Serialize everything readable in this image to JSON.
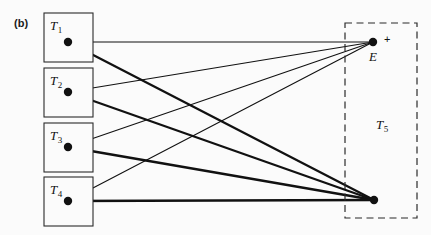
{
  "figure": {
    "panel_label": "(b)",
    "width": 431,
    "height": 235,
    "background_color": "#fbfbfb",
    "ink_color": "#111111"
  },
  "terminals": [
    {
      "id": "T1",
      "label": "T",
      "subscript": "1",
      "box": {
        "x": 44,
        "y": 13,
        "w": 49,
        "h": 49
      },
      "node": {
        "x": 68,
        "y": 42
      },
      "label_pos": {
        "x": 50,
        "y": 30
      }
    },
    {
      "id": "T2",
      "label": "T",
      "subscript": "2",
      "box": {
        "x": 44,
        "y": 68,
        "w": 49,
        "h": 49
      },
      "node": {
        "x": 68,
        "y": 92
      },
      "label_pos": {
        "x": 50,
        "y": 85
      }
    },
    {
      "id": "T3",
      "label": "T",
      "subscript": "3",
      "box": {
        "x": 44,
        "y": 123,
        "w": 49,
        "h": 49
      },
      "node": {
        "x": 68,
        "y": 147
      },
      "label_pos": {
        "x": 50,
        "y": 140
      }
    },
    {
      "id": "T4",
      "label": "T",
      "subscript": "4",
      "box": {
        "x": 44,
        "y": 177,
        "w": 49,
        "h": 49
      },
      "node": {
        "x": 68,
        "y": 201
      },
      "label_pos": {
        "x": 50,
        "y": 194
      }
    }
  ],
  "region": {
    "id": "T5",
    "label": "T",
    "subscript": "5",
    "box": {
      "x": 345,
      "y": 23,
      "w": 72,
      "h": 195
    },
    "label_pos": {
      "x": 376,
      "y": 129
    },
    "style": "dashed"
  },
  "endpoints": [
    {
      "id": "E",
      "label": "E",
      "sign": "+",
      "node": {
        "x": 373,
        "y": 42
      },
      "label_pos": {
        "x": 369,
        "y": 61
      },
      "sign_pos": {
        "x": 384,
        "y": 43
      }
    },
    {
      "id": "ground",
      "label": "",
      "sign": "",
      "node": {
        "x": 374,
        "y": 200
      },
      "label_pos": null,
      "sign_pos": null
    }
  ],
  "edges": [
    {
      "from": "T1",
      "to": "E",
      "weight": "thin"
    },
    {
      "from": "T2",
      "to": "E",
      "weight": "thin"
    },
    {
      "from": "T3",
      "to": "E",
      "weight": "thin"
    },
    {
      "from": "T4",
      "to": "E",
      "weight": "thin"
    },
    {
      "from": "T1",
      "to": "ground",
      "weight": "thick"
    },
    {
      "from": "T2",
      "to": "ground",
      "weight": "thick"
    },
    {
      "from": "T3",
      "to": "ground",
      "weight": "thick"
    },
    {
      "from": "T4",
      "to": "ground",
      "weight": "thick"
    }
  ],
  "node_radius": 4.2
}
